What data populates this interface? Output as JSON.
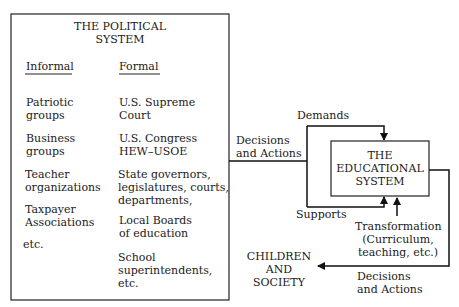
{
  "political_system": {
    "title_line1": "THE POLITICAL",
    "title_line2": "SYSTEM",
    "informal": {
      "header": "Informal",
      "items": [
        [
          "Patriotic",
          "groups"
        ],
        [
          "Business",
          "groups"
        ],
        [
          "Teacher",
          "organizations"
        ],
        [
          "Taxpayer",
          "Associations"
        ],
        [
          "etc."
        ]
      ]
    },
    "formal": {
      "header": "Formal",
      "items": [
        [
          "U.S. Supreme",
          "Court"
        ],
        [
          "U.S. Congress"
        ],
        [
          "HEW–USOE"
        ],
        [
          "State governors,",
          "legislatures, courts,",
          "departments,"
        ],
        [
          "Local Boards",
          "of education"
        ],
        [
          "School",
          "superintendents,",
          "etc."
        ]
      ]
    }
  },
  "educational_system": {
    "line1": "THE",
    "line2": "EDUCATIONAL",
    "line3": "SYSTEM"
  },
  "children_society": {
    "line1": "CHILDREN",
    "line2": "AND",
    "line3": "SOCIETY"
  },
  "labels": {
    "demands": "Demands",
    "supports": "Supports",
    "decisions_in_1": "Decisions",
    "decisions_in_2": "and Actions",
    "transformation_1": "Transformation",
    "transformation_2": "(Curriculum,",
    "transformation_3": "teaching, etc.)",
    "decisions_out_1": "Decisions",
    "decisions_out_2": "and Actions"
  }
}
